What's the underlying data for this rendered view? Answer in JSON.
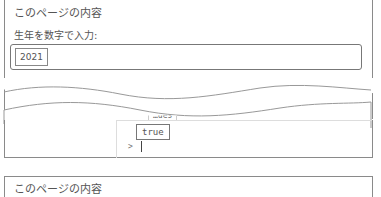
{
  "top_panel": {
    "title": "このページの内容",
    "prompt_label": "生年を数字で入力:",
    "input_value": "2021"
  },
  "console": {
    "partial_text": "…ues",
    "result": "true",
    "prompt_symbol": ">"
  },
  "bottom_panel": {
    "title": "このページの内容"
  }
}
